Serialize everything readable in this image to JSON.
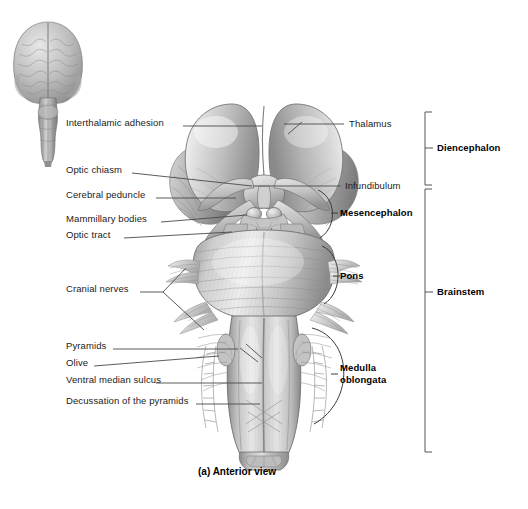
{
  "figure": {
    "caption": "(a) Anterior view",
    "inset_name": "whole-brain-anterior-inset"
  },
  "colors": {
    "ink": "#1b1b1b",
    "leader": "#4a4a4a",
    "bracket": "#555555",
    "tissue_light": "#e9e9e9",
    "tissue_mid": "#b5b5b5",
    "tissue_dark": "#7d7d7d",
    "background": "#ffffff"
  },
  "left_labels": [
    {
      "id": "interthalamic-adhesion",
      "text": "Interthalamic adhesion",
      "x": 66,
      "y": 122
    },
    {
      "id": "optic-chiasm",
      "text": "Optic chiasm",
      "x": 66,
      "y": 169
    },
    {
      "id": "cerebral-peduncle",
      "text": "Cerebral peduncle",
      "x": 66,
      "y": 194
    },
    {
      "id": "mammillary-bodies",
      "text": "Mammillary bodies",
      "x": 66,
      "y": 218
    },
    {
      "id": "optic-tract",
      "text": "Optic tract",
      "x": 66,
      "y": 234
    },
    {
      "id": "cranial-nerves",
      "text": "Cranial nerves",
      "x": 66,
      "y": 288
    },
    {
      "id": "pyramids",
      "text": "Pyramids",
      "x": 66,
      "y": 345
    },
    {
      "id": "olive",
      "text": "Olive",
      "x": 66,
      "y": 362
    },
    {
      "id": "ventral-median-sulcus",
      "text": "Ventral median sulcus",
      "x": 66,
      "y": 379
    },
    {
      "id": "decussation-of-the-pyramids",
      "text": "Decussation of the pyramids",
      "x": 66,
      "y": 400
    }
  ],
  "right_labels": [
    {
      "id": "thalamus",
      "text": "Thalamus",
      "x": 349,
      "y": 119,
      "bold": false
    },
    {
      "id": "infundibulum",
      "text": "Infundibulum",
      "x": 345,
      "y": 181,
      "bold": false
    }
  ],
  "region_labels": [
    {
      "id": "mesencephalon",
      "text": "Mesencephalon",
      "x": 340,
      "y": 213,
      "bold": true
    },
    {
      "id": "pons",
      "text": "Pons",
      "x": 340,
      "y": 276,
      "bold": true
    },
    {
      "id": "medulla-oblongata",
      "line1": "Medulla",
      "line2": "oblongata",
      "x": 340,
      "y": 368,
      "bold": true
    }
  ],
  "bracket_labels": [
    {
      "id": "diencephalon",
      "text": "Diencephalon",
      "x": 437,
      "y": 148,
      "bold": true
    },
    {
      "id": "brainstem",
      "text": "Brainstem",
      "x": 437,
      "y": 292,
      "bold": true
    }
  ]
}
